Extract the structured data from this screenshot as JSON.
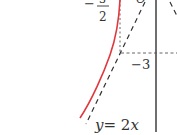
{
  "diagram": {
    "labels": {
      "frac_sign": "−",
      "frac_num": "3",
      "frac_den": "2",
      "origin": "O",
      "y_tick": "−3",
      "line_eq_y": "y",
      "line_eq_rest": "= 2",
      "line_eq_x": "x"
    },
    "colors": {
      "curve": "#e0383e",
      "axis": "#222222",
      "dashed": "#333333",
      "text": "#333333"
    }
  }
}
